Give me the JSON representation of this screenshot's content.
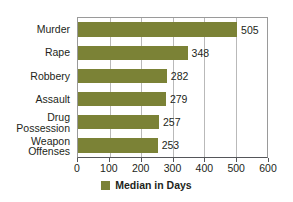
{
  "chart_data": {
    "type": "bar",
    "orientation": "horizontal",
    "title": "",
    "xlabel": "",
    "ylabel": "",
    "categories": [
      "Murder",
      "Rape",
      "Robbery",
      "Assault",
      "Drug Possession",
      "Weapon Offenses"
    ],
    "values": [
      505,
      348,
      282,
      279,
      257,
      253
    ],
    "series": [
      {
        "name": "Median in Days",
        "values": [
          505,
          348,
          282,
          279,
          257,
          253
        ]
      }
    ],
    "data_labels": [
      "505",
      "348",
      "282",
      "279",
      "257",
      "253"
    ],
    "xlim": [
      0,
      600
    ],
    "xticks": [
      0,
      100,
      200,
      300,
      400,
      500,
      600
    ],
    "xtick_labels": [
      "0",
      "100",
      "200",
      "300",
      "400",
      "500",
      "600"
    ],
    "grid": "vertical",
    "legend": {
      "position": "bottom",
      "entries": [
        "Median in Days"
      ]
    },
    "colors": {
      "bar": "#7b8236",
      "text": "#231f20",
      "gridline": "#b9b9b9",
      "axis": "#55565a",
      "background": "#ffffff"
    }
  },
  "legend": {
    "label": "Median in Days",
    "swatch_icon": "legend-color-swatch"
  }
}
